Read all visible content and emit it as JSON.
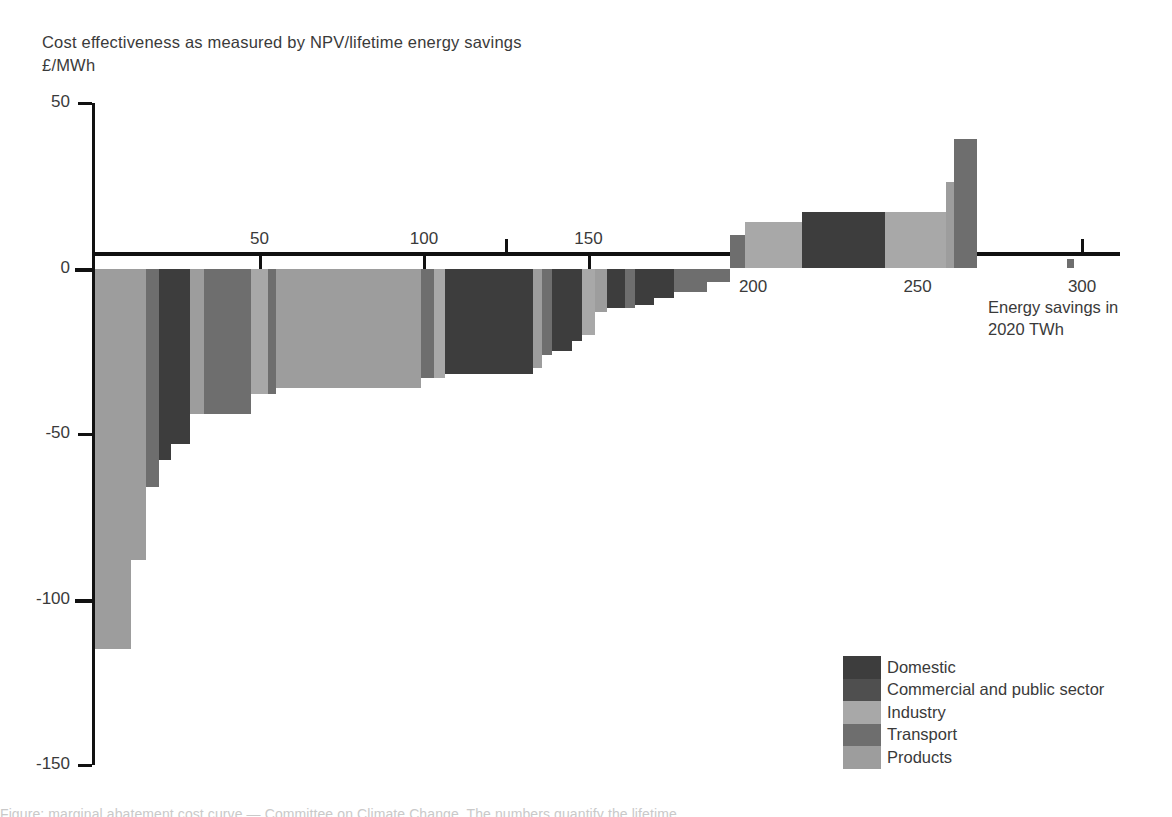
{
  "title": {
    "line1": "Cost effectiveness as measured by NPV/lifetime energy savings",
    "line2": "£/MWh"
  },
  "axis_label_right": {
    "line1": "Energy savings in",
    "line2": "2020 TWh"
  },
  "legend": {
    "items": [
      {
        "label": "Domestic",
        "color": "#3d3d3d"
      },
      {
        "label": "Commercial and public sector",
        "color": "#4f4f4f"
      },
      {
        "label": "Industry",
        "color": "#a8a8a8"
      },
      {
        "label": "Transport",
        "color": "#6e6e6e"
      },
      {
        "label": "Products",
        "color": "#9d9d9d"
      }
    ]
  },
  "footnote": "Figure: marginal abatement cost curve — Committee on Climate Change. The numbers quantify the lifetime",
  "chart_data": {
    "type": "bar",
    "title": "Cost effectiveness as measured by NPV/lifetime energy savings",
    "xlabel": "Energy savings in 2020 TWh",
    "ylabel": "£/MWh",
    "xlim": [
      0,
      310
    ],
    "ylim": [
      -150,
      50
    ],
    "xticks": [
      50,
      100,
      150,
      200,
      250,
      300
    ],
    "yticks": [
      50,
      0,
      -50,
      -100,
      -150
    ],
    "grid": false,
    "legend_position": "bottom-right",
    "note": "Width of each bar = energy savings (TWh); height = cost effectiveness (£/MWh). Bars ordered from most to least cost-effective.",
    "bars": [
      {
        "x0": 0.0,
        "x1": 11.0,
        "value": -115,
        "sector": "Products"
      },
      {
        "x0": 11.0,
        "x1": 15.5,
        "value": -88,
        "sector": "Products"
      },
      {
        "x0": 15.5,
        "x1": 19.5,
        "value": -66,
        "sector": "Transport"
      },
      {
        "x0": 19.5,
        "x1": 23.0,
        "value": -58,
        "sector": "Domestic"
      },
      {
        "x0": 23.0,
        "x1": 29.0,
        "value": -53,
        "sector": "Domestic"
      },
      {
        "x0": 29.0,
        "x1": 33.0,
        "value": -44,
        "sector": "Products"
      },
      {
        "x0": 33.0,
        "x1": 47.5,
        "value": -44,
        "sector": "Transport"
      },
      {
        "x0": 47.5,
        "x1": 52.5,
        "value": -38,
        "sector": "Industry"
      },
      {
        "x0": 52.5,
        "x1": 55.0,
        "value": -38,
        "sector": "Transport"
      },
      {
        "x0": 55.0,
        "x1": 99.0,
        "value": -36,
        "sector": "Products"
      },
      {
        "x0": 99.0,
        "x1": 103.0,
        "value": -33,
        "sector": "Transport"
      },
      {
        "x0": 103.0,
        "x1": 106.5,
        "value": -33,
        "sector": "Industry"
      },
      {
        "x0": 106.5,
        "x1": 112.0,
        "value": -32,
        "sector": "Domestic"
      },
      {
        "x0": 112.0,
        "x1": 133.0,
        "value": -32,
        "sector": "Domestic"
      },
      {
        "x0": 133.0,
        "x1": 136.0,
        "value": -30,
        "sector": "Products"
      },
      {
        "x0": 136.0,
        "x1": 139.0,
        "value": -26,
        "sector": "Transport"
      },
      {
        "x0": 139.0,
        "x1": 145.0,
        "value": -25,
        "sector": "Domestic"
      },
      {
        "x0": 145.0,
        "x1": 148.0,
        "value": -22,
        "sector": "Domestic"
      },
      {
        "x0": 148.0,
        "x1": 152.0,
        "value": -20,
        "sector": "Industry"
      },
      {
        "x0": 152.0,
        "x1": 155.5,
        "value": -13,
        "sector": "Products"
      },
      {
        "x0": 155.5,
        "x1": 161.0,
        "value": -12,
        "sector": "Domestic"
      },
      {
        "x0": 161.0,
        "x1": 164.0,
        "value": -12,
        "sector": "Transport"
      },
      {
        "x0": 164.0,
        "x1": 170.0,
        "value": -11,
        "sector": "Domestic"
      },
      {
        "x0": 170.0,
        "x1": 176.0,
        "value": -9,
        "sector": "Domestic"
      },
      {
        "x0": 176.0,
        "x1": 186.0,
        "value": -7,
        "sector": "Transport"
      },
      {
        "x0": 186.0,
        "x1": 193.0,
        "value": -4,
        "sector": "Transport"
      },
      {
        "x0": 193.0,
        "x1": 197.5,
        "value": 10,
        "sector": "Transport"
      },
      {
        "x0": 197.5,
        "x1": 215.0,
        "value": 14,
        "sector": "Industry"
      },
      {
        "x0": 215.0,
        "x1": 240.0,
        "value": 17,
        "sector": "Domestic"
      },
      {
        "x0": 240.0,
        "x1": 258.5,
        "value": 17,
        "sector": "Industry"
      },
      {
        "x0": 258.5,
        "x1": 261.0,
        "value": 26,
        "sector": "Products"
      },
      {
        "x0": 261.0,
        "x1": 268.0,
        "value": 39,
        "sector": "Transport"
      },
      {
        "x0": 295.5,
        "x1": 297.5,
        "value": 3,
        "sector": "Transport"
      }
    ]
  }
}
